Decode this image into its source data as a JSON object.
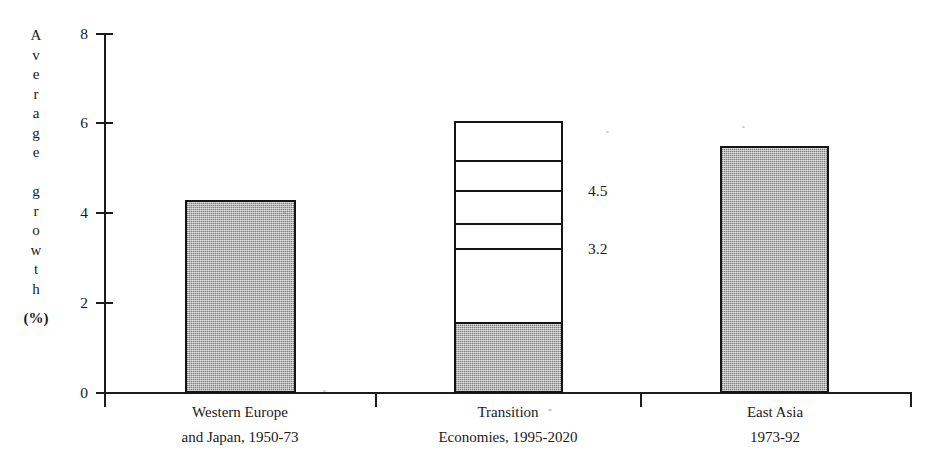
{
  "chart_data": {
    "type": "bar",
    "title": "",
    "subtitle": "",
    "xlabel": "",
    "ylabel": "Average growth (%)",
    "ylabel_letters": [
      "A",
      "v",
      "e",
      "r",
      "a",
      "g",
      "e",
      "",
      "g",
      "r",
      "o",
      "w",
      "t",
      "h"
    ],
    "ylabel_units": "(%)",
    "ylim": [
      0,
      8
    ],
    "yticks": [
      0,
      2,
      4,
      6,
      8
    ],
    "ytick_labels": [
      "0",
      "2",
      "4",
      "6",
      "8"
    ],
    "grid": false,
    "legend": "none",
    "categories": [
      "Western Europe and Japan, 1950-73",
      "Transition Economies, 1995-2020",
      "East Asia 1973-92"
    ],
    "category_labels": [
      {
        "line1": "Western Europe",
        "line2": "and Japan, 1950-73"
      },
      {
        "line1": "Transition",
        "line2": "Economies, 1995-2020"
      },
      {
        "line1": "East Asia",
        "line2": "1973-92"
      }
    ],
    "values": [
      4.3,
      6.05,
      5.5
    ],
    "bars": [
      {
        "name": "western-europe-japan",
        "value": 4.3,
        "style": "solid-grey",
        "filled_value": 4.3,
        "segments": []
      },
      {
        "name": "transition-economies",
        "value": 6.05,
        "style": "stacked-open",
        "filled_value": 1.58,
        "segments": [
          1.58,
          3.2,
          3.75,
          4.5,
          5.15,
          6.05
        ]
      },
      {
        "name": "east-asia",
        "value": 5.5,
        "style": "solid-grey",
        "filled_value": 5.5,
        "segments": []
      }
    ],
    "annotations": [
      {
        "name": "annotation-upper",
        "text": "4.5",
        "value": 4.5
      },
      {
        "name": "annotation-lower",
        "text": "3.2",
        "value": 3.2
      }
    ]
  },
  "colors": {
    "axis": "#1c1c1c",
    "bar_fill": "#b4b4b4",
    "bar_outline": "#141414",
    "open_fill": "#ffffff",
    "text": "#1a1a1a",
    "background": "#ffffff"
  }
}
